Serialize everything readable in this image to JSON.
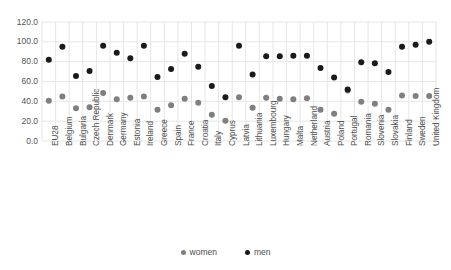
{
  "chart_data": {
    "type": "scatter",
    "title": "",
    "subtitle": "",
    "xlabel": "",
    "ylabel": "",
    "ylim": [
      0,
      120
    ],
    "yticks": [
      "0.0",
      "20.0",
      "40.0",
      "60.0",
      "80.0",
      "100.0",
      "120.0"
    ],
    "ytick_values": [
      0,
      20,
      40,
      60,
      80,
      100,
      120
    ],
    "grid": true,
    "legend_position": "bottom",
    "categories": [
      "EU28",
      "Belgium",
      "Bulgaria",
      "Czech Republic",
      "Denmark",
      "Germany",
      "Estonia",
      "Ireland",
      "Greece",
      "Spain",
      "France",
      "Croatia",
      "Italy",
      "Cyprus",
      "Latvia",
      "Lithuania",
      "Luxembourg",
      "Hungary",
      "Malta",
      "Netherland",
      "Austria",
      "Poland",
      "Portugal",
      "Romania",
      "Slovenia",
      "Slovakia",
      "Finland",
      "Sweden",
      "United Kingdom"
    ],
    "series": [
      {
        "name": "women",
        "color": "#7f7f7f",
        "values": [
          40.5,
          45.0,
          33.0,
          34.0,
          48.5,
          42.0,
          43.5,
          45.0,
          31.5,
          36.0,
          42.5,
          38.5,
          26.5,
          20.5,
          44.0,
          33.5,
          43.5,
          42.5,
          42.0,
          43.0,
          31.5,
          27.5,
          51.0,
          39.5,
          37.5,
          31.5,
          46.0,
          45.5,
          45.5
        ]
      },
      {
        "name": "men",
        "color": "#1a1a1a",
        "values": [
          82.0,
          95.0,
          65.5,
          70.5,
          96.0,
          89.0,
          83.5,
          96.0,
          64.5,
          72.5,
          88.0,
          75.0,
          55.5,
          44.0,
          96.0,
          67.0,
          85.5,
          85.5,
          86.0,
          86.0,
          73.5,
          64.0,
          52.0,
          79.5,
          78.5,
          69.5,
          95.0,
          97.0,
          100.0
        ]
      }
    ],
    "legend": [
      {
        "label": "women",
        "color": "#7f7f7f"
      },
      {
        "label": "men",
        "color": "#1a1a1a"
      }
    ]
  },
  "layout": {
    "plot_left": 42,
    "plot_right": 436,
    "plot_top": 22,
    "plot_bottom": 141,
    "grid_color": "#e6e6e6",
    "background": "#ffffff",
    "marker_radius": 3.0
  }
}
